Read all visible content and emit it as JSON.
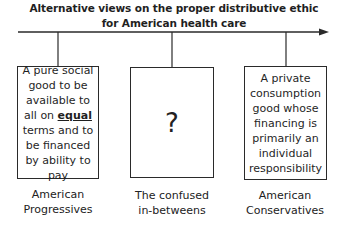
{
  "title": {
    "line1": "Alternative views on the proper distributive ethic",
    "line2": "for American health care"
  },
  "views": [
    {
      "text_before": "A pure social good to be available to all on ",
      "emphasis": "equal",
      "text_after": " terms and to be financed by ability to pay",
      "label_line1": "American",
      "label_line2": "Progressives"
    },
    {
      "text": "?",
      "label_line1": "The confused",
      "label_line2": "in-betweens"
    },
    {
      "text": "A private consumption good whose financing is primarily an individual responsibility",
      "label_line1": "American",
      "label_line2": "Conservatives"
    }
  ]
}
